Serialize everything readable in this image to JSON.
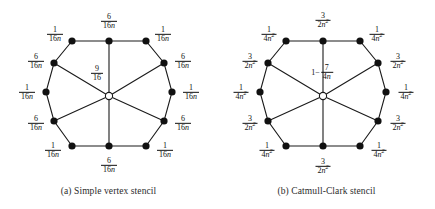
{
  "figure": {
    "width": 435,
    "height": 209,
    "background": "#ffffff",
    "stroke_color": "#1a1a1a",
    "vertex_color": "#111111"
  },
  "panels": [
    {
      "id": "simple-vertex",
      "caption": "(a) Simple vertex stencil",
      "center_label": {
        "type": "fraction",
        "numerator": "9",
        "denominator": "16",
        "text": "9/16"
      },
      "labels": [
        {
          "position": "top",
          "numerator": "6",
          "denominator": "16n",
          "text": "6/16n"
        },
        {
          "position": "top-left",
          "numerator": "1",
          "denominator": "16n",
          "text": "1/16n"
        },
        {
          "position": "top-right",
          "numerator": "1",
          "denominator": "16n",
          "text": "1/16n"
        },
        {
          "position": "upper-left",
          "numerator": "6",
          "denominator": "16n",
          "text": "6/16n"
        },
        {
          "position": "upper-right",
          "numerator": "6",
          "denominator": "16n",
          "text": "6/16n"
        },
        {
          "position": "left",
          "numerator": "1",
          "denominator": "16n",
          "text": "1/16n"
        },
        {
          "position": "right",
          "numerator": "1",
          "denominator": "16n",
          "text": "1/16n"
        },
        {
          "position": "lower-left",
          "numerator": "6",
          "denominator": "16n",
          "text": "6/16n"
        },
        {
          "position": "lower-right",
          "numerator": "6",
          "denominator": "16n",
          "text": "6/16n"
        },
        {
          "position": "bottom-left",
          "numerator": "1",
          "denominator": "16n",
          "text": "1/16n"
        },
        {
          "position": "bottom-right",
          "numerator": "1",
          "denominator": "16n",
          "text": "1/16n"
        },
        {
          "position": "bottom",
          "numerator": "6",
          "denominator": "16n",
          "text": "6/16n"
        }
      ]
    },
    {
      "id": "catmull-clark",
      "caption": "(b) Catmull-Clark stencil",
      "center_label": {
        "type": "mixed",
        "lead": "1−",
        "numerator": "7",
        "denominator": "4n",
        "text": "1 − 7/4n"
      },
      "labels": [
        {
          "position": "top",
          "numerator": "3",
          "denominator": "2n²",
          "text": "3/2n^2"
        },
        {
          "position": "top-left",
          "numerator": "1",
          "denominator": "4n²",
          "text": "1/4n^2"
        },
        {
          "position": "top-right",
          "numerator": "1",
          "denominator": "4n²",
          "text": "1/4n^2"
        },
        {
          "position": "upper-left",
          "numerator": "3",
          "denominator": "2n²",
          "text": "3/2n^2"
        },
        {
          "position": "upper-right",
          "numerator": "3",
          "denominator": "2n²",
          "text": "3/2n^2"
        },
        {
          "position": "left",
          "numerator": "1",
          "denominator": "4n²",
          "text": "1/4n^2"
        },
        {
          "position": "right",
          "numerator": "1",
          "denominator": "4n²",
          "text": "1/4n^2"
        },
        {
          "position": "lower-left",
          "numerator": "3",
          "denominator": "2n²",
          "text": "3/2n^2"
        },
        {
          "position": "lower-right",
          "numerator": "3",
          "denominator": "2n²",
          "text": "3/2n^2"
        },
        {
          "position": "bottom-left",
          "numerator": "1",
          "denominator": "4n²",
          "text": "1/4n^2"
        },
        {
          "position": "bottom-right",
          "numerator": "1",
          "denominator": "4n²",
          "text": "1/4n^2"
        },
        {
          "position": "bottom",
          "numerator": "3",
          "denominator": "2n²",
          "text": "3/2n^2"
        }
      ]
    }
  ]
}
